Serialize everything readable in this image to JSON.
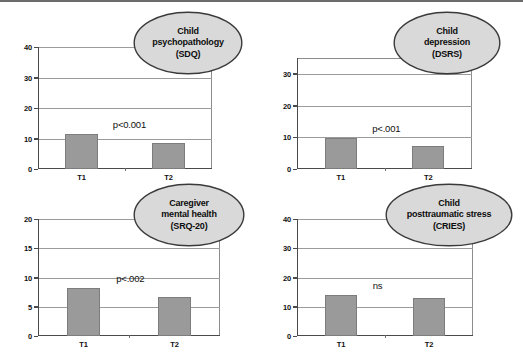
{
  "figure": {
    "width": 523,
    "height": 358,
    "background": "#ffffff",
    "bar_color": "#9a9a9a",
    "bar_edge_color": "#7d7d7d",
    "axis_color": "#4a4a4a",
    "grid_color": "#9b9b9b",
    "callout_fill": "#d9d9d9",
    "callout_stroke": "#3a3a3a"
  },
  "chart_data": [
    {
      "id": "child-psychopathology",
      "type": "bar",
      "title": "Child psychopathology (SDQ)",
      "title_lines": [
        "Child",
        "psychopathology",
        "(SDQ)"
      ],
      "categories": [
        "T1",
        "T2"
      ],
      "values": [
        11.6,
        8.5
      ],
      "annotation": "p<0.001",
      "xlabel": "",
      "ylabel": "",
      "ylim": [
        0,
        40
      ],
      "yticks": [
        0,
        10,
        20,
        30,
        40
      ],
      "ytick_labels": [
        "0",
        "10",
        "20",
        "30",
        "40"
      ],
      "grid": true,
      "legend": "none"
    },
    {
      "id": "child-depression",
      "type": "bar",
      "title": "Child depression (DSRS)",
      "title_lines": [
        "Child",
        "depression",
        "(DSRS)"
      ],
      "categories": [
        "T1",
        "T2"
      ],
      "values": [
        9.8,
        7.3
      ],
      "annotation": "p<.001",
      "xlabel": "",
      "ylabel": "",
      "ylim": [
        0,
        35
      ],
      "yticks": [
        0,
        10,
        20,
        30
      ],
      "ytick_labels": [
        "0",
        "10",
        "20",
        "30"
      ],
      "grid": true,
      "legend": "none"
    },
    {
      "id": "caregiver-mental-health",
      "type": "bar",
      "title": "Caregiver mental health (SRQ-20)",
      "title_lines": [
        "Caregiver",
        "mental health",
        "(SRQ-20)"
      ],
      "categories": [
        "T1",
        "T2"
      ],
      "values": [
        8.2,
        6.6
      ],
      "annotation": "p<.002",
      "xlabel": "",
      "ylabel": "",
      "ylim": [
        0,
        20
      ],
      "yticks": [
        0,
        5,
        10,
        15,
        20
      ],
      "ytick_labels": [
        "0",
        "5",
        "10",
        "15",
        "20"
      ],
      "grid": true,
      "legend": "none"
    },
    {
      "id": "child-posttraumatic-stress",
      "type": "bar",
      "title": "Child posttraumatic stress (CRIES)",
      "title_lines": [
        "Child",
        "posttraumatic stress",
        "(CRIES)"
      ],
      "categories": [
        "T1",
        "T2"
      ],
      "values": [
        14.1,
        13.0
      ],
      "annotation": "ns",
      "xlabel": "",
      "ylabel": "",
      "ylim": [
        0,
        40
      ],
      "yticks": [
        0,
        10,
        20,
        30,
        40
      ],
      "ytick_labels": [
        "0",
        "10",
        "20",
        "30",
        "40"
      ],
      "grid": true,
      "legend": "none"
    }
  ]
}
